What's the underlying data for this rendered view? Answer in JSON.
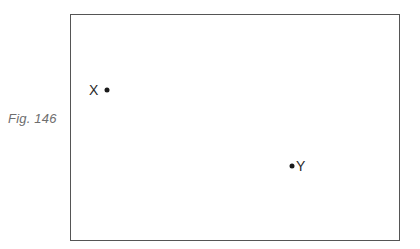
{
  "caption": {
    "text": "Fig. 146"
  },
  "frame": {
    "border_color": "#555555"
  },
  "points": [
    {
      "id": "X",
      "label": "X",
      "label_side": "left",
      "x": 107,
      "y": 90
    },
    {
      "id": "Y",
      "label": "Y",
      "label_side": "right",
      "x": 292,
      "y": 166
    }
  ]
}
